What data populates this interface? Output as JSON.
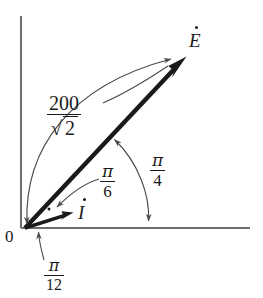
{
  "figure": {
    "background_color": "#ffffff",
    "stroke_color": "#4a4a4a",
    "bold_stroke_color": "#1a1a1a",
    "text_color": "#1a1a1a",
    "width": 263,
    "height": 298
  },
  "axes": {
    "origin_label": "0",
    "vertical": {
      "x": 21,
      "y_top": 16,
      "y_bottom": 228
    },
    "horizontal": {
      "y": 228,
      "x_left": 21,
      "x_right": 250
    }
  },
  "phasors": [
    {
      "name": "voltage-phasor",
      "label": "E",
      "label_dot": true,
      "angle_text": "π/4",
      "magnitude_text": "200/√2",
      "tip_x": 186,
      "tip_y": 57
    },
    {
      "name": "current-phasor",
      "label": "I",
      "label_dot": true,
      "angle_text": "π/12",
      "tip_x": 72,
      "tip_y": 213
    }
  ],
  "labels": {
    "magnitude": {
      "numerator": "200",
      "denominator_radicand": "2",
      "radical": "√"
    },
    "angle_between": {
      "numerator": "π",
      "denominator": "6"
    },
    "angle_voltage": {
      "numerator": "π",
      "denominator": "4"
    },
    "angle_current": {
      "numerator": "π",
      "denominator": "12"
    },
    "voltage_symbol": "E",
    "current_symbol": "I",
    "origin": "0"
  }
}
